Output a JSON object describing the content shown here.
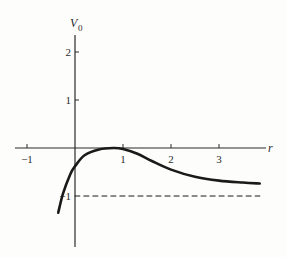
{
  "chart_data": {
    "type": "line",
    "title": "",
    "xlabel": "r",
    "ylabel": "V",
    "ylabel_subscript": "0",
    "xlim": [
      -1.3,
      3.9
    ],
    "ylim": [
      -1.8,
      2.5
    ],
    "grid": false,
    "x_ticks": [
      "-1",
      "1",
      "2",
      "3"
    ],
    "y_ticks": [
      "2",
      "1",
      "-1"
    ],
    "series": [
      {
        "name": "V0(r)",
        "style": "solid",
        "x": [
          -0.35,
          -0.25,
          -0.1,
          0.0,
          0.2,
          0.5,
          0.8,
          1.0,
          1.3,
          1.6,
          2.0,
          2.5,
          3.0,
          3.5,
          3.85
        ],
        "y": [
          -1.35,
          -0.95,
          -0.55,
          -0.38,
          -0.15,
          -0.03,
          0.0,
          -0.02,
          -0.12,
          -0.27,
          -0.45,
          -0.6,
          -0.68,
          -0.72,
          -0.74
        ]
      },
      {
        "name": "asymptote",
        "style": "dashed",
        "x": [
          0.0,
          3.85
        ],
        "y": [
          -1.0,
          -1.0
        ]
      }
    ]
  }
}
